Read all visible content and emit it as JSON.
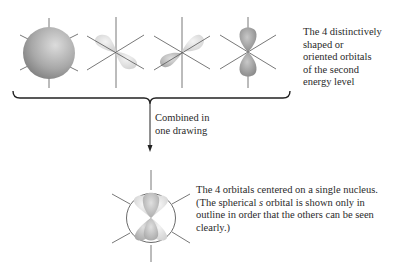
{
  "figure": {
    "top_caption": {
      "lines": [
        "The 4 distinctively",
        "shaped or",
        "oriented orbitals",
        "of the second",
        "energy level"
      ]
    },
    "arrow_caption": {
      "lines": [
        "Combined in",
        "one drawing"
      ]
    },
    "bottom_caption": {
      "lines": [
        "The 4 orbitals centered on a single nucleus.",
        "(The spherical s orbital is shown only in",
        "outline in order that the others can be seen",
        "clearly.)"
      ],
      "italic_word": "s"
    },
    "orbitals": [
      {
        "name": "s-orbital",
        "shape": "sphere"
      },
      {
        "name": "p-orbital-1",
        "shape": "dumbbell-diagonal"
      },
      {
        "name": "p-orbital-2",
        "shape": "dumbbell-diagonal-opposite"
      },
      {
        "name": "p-orbital-3",
        "shape": "dumbbell-vertical"
      }
    ],
    "colors": {
      "sphere_dark": "#8a8a8a",
      "sphere_light": "#d8d8d8",
      "lobe_light": "#e6e6e6",
      "lobe_dark": "#9a9a9a",
      "axis": "#555555"
    }
  }
}
